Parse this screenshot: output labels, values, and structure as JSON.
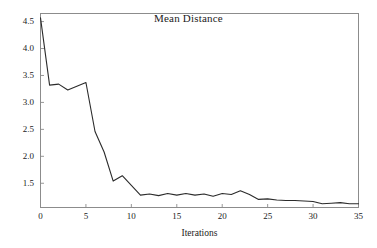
{
  "chart_data": {
    "type": "line",
    "title": "Mean Distance",
    "xlabel": "Iterations",
    "ylabel": "",
    "xlim": [
      0,
      35
    ],
    "ylim": [
      1.05,
      4.65
    ],
    "grid": false,
    "legend": "none",
    "x_ticks": [
      "0",
      "5",
      "10",
      "15",
      "20",
      "25",
      "30",
      "35"
    ],
    "x_tick_values": [
      0,
      5,
      10,
      15,
      20,
      25,
      30,
      35
    ],
    "y_ticks": [
      "1.5",
      "2.0",
      "2.5",
      "3.0",
      "3.5",
      "4.0",
      "4.5"
    ],
    "y_tick_values": [
      1.5,
      2.0,
      2.5,
      3.0,
      3.5,
      4.0,
      4.5
    ],
    "line_color": "#2b2b2b",
    "frame_color": "#8c8c8c",
    "background_color": "#ffffff",
    "x": [
      0,
      1,
      2,
      3,
      4,
      5,
      6,
      7,
      8,
      9,
      10,
      11,
      12,
      13,
      14,
      15,
      16,
      17,
      18,
      19,
      20,
      21,
      22,
      23,
      24,
      25,
      26,
      27,
      28,
      29,
      30,
      31,
      32,
      33,
      34,
      35
    ],
    "values": [
      4.57,
      3.32,
      3.34,
      3.23,
      3.3,
      3.37,
      2.46,
      2.08,
      1.54,
      1.64,
      1.46,
      1.28,
      1.3,
      1.27,
      1.31,
      1.28,
      1.31,
      1.28,
      1.3,
      1.26,
      1.31,
      1.29,
      1.36,
      1.29,
      1.2,
      1.21,
      1.19,
      1.18,
      1.18,
      1.17,
      1.16,
      1.12,
      1.13,
      1.14,
      1.12,
      1.12
    ],
    "series": [
      {
        "name": "Mean Distance",
        "values": [
          4.57,
          3.32,
          3.34,
          3.23,
          3.3,
          3.37,
          2.46,
          2.08,
          1.54,
          1.64,
          1.46,
          1.28,
          1.3,
          1.27,
          1.31,
          1.28,
          1.31,
          1.28,
          1.3,
          1.26,
          1.31,
          1.29,
          1.36,
          1.29,
          1.2,
          1.21,
          1.19,
          1.18,
          1.18,
          1.17,
          1.16,
          1.12,
          1.13,
          1.14,
          1.12,
          1.12
        ]
      }
    ]
  }
}
